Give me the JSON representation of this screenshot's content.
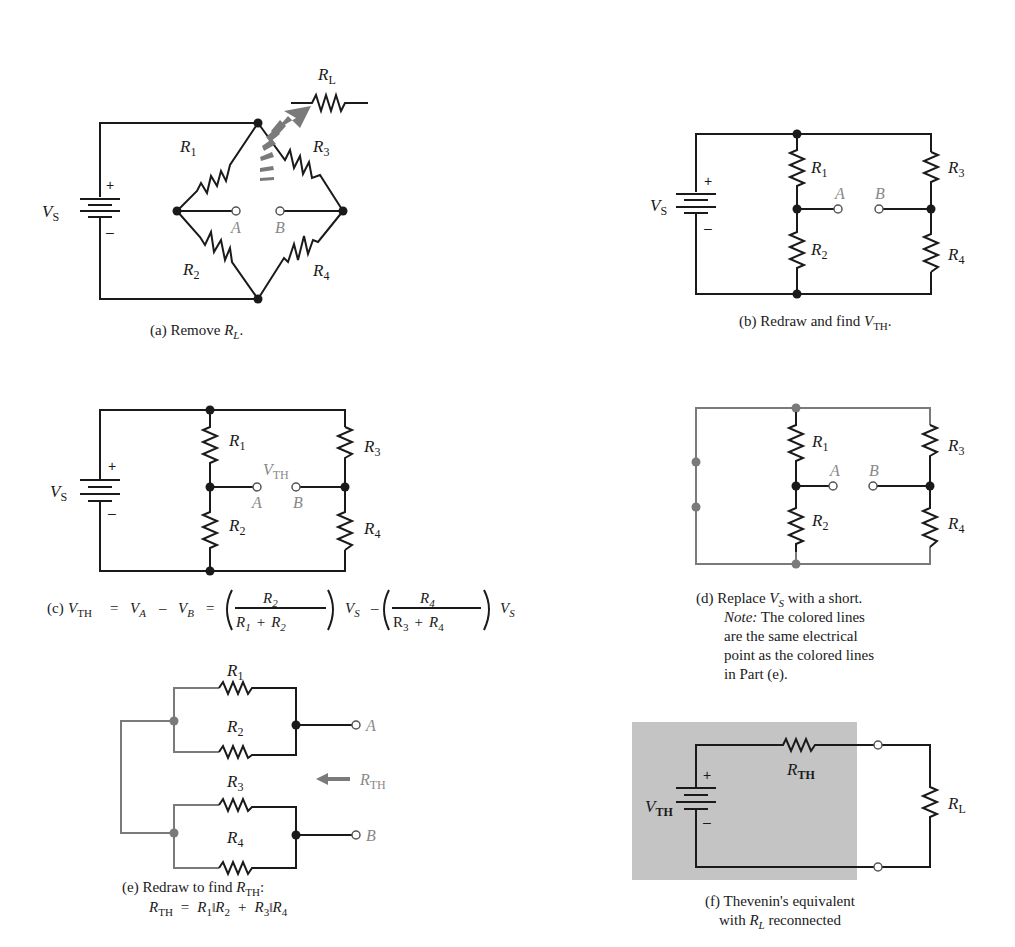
{
  "figure": {
    "panels": [
      {
        "id": "a",
        "caption_prefix": "(a) Remove ",
        "caption_var": "R",
        "caption_sub": "L",
        "caption_suffix": ".",
        "labels": {
          "source": "V",
          "source_sub": "S",
          "r1": "R",
          "r1_sub": "1",
          "r2": "R",
          "r2_sub": "2",
          "r3": "R",
          "r3_sub": "3",
          "r4": "R",
          "r4_sub": "4",
          "rl": "R",
          "rl_sub": "L",
          "a": "A",
          "b": "B",
          "plus": "+",
          "minus": "–"
        }
      },
      {
        "id": "b",
        "caption_prefix": "(b) Redraw and find ",
        "caption_var": "V",
        "caption_sub": "TH",
        "caption_suffix": ".",
        "labels": {
          "source": "V",
          "source_sub": "S",
          "r1": "R",
          "r1_sub": "1",
          "r2": "R",
          "r2_sub": "2",
          "r3": "R",
          "r3_sub": "3",
          "r4": "R",
          "r4_sub": "4",
          "a": "A",
          "b": "B",
          "plus": "+",
          "minus": "–"
        }
      },
      {
        "id": "c",
        "caption_prefix": "(c) ",
        "equation": {
          "lhs": "V",
          "lhs_sub": "TH",
          "eq1": "=",
          "va": "V",
          "va_sub": "A",
          "minus": "–",
          "vb": "V",
          "vb_sub": "B",
          "eq2": "=",
          "frac1_num": "R",
          "frac1_num_sub": "2",
          "frac1_den_a": "R",
          "frac1_den_a_sub": "1",
          "frac1_den_plus": "+",
          "frac1_den_b": "R",
          "frac1_den_b_sub": "2",
          "vs1": "V",
          "vs1_sub": "S",
          "frac2_num": "R",
          "frac2_num_sub": "4",
          "frac2_den_a": "R",
          "frac2_den_a_sub": "3",
          "frac2_den_plus": "+",
          "frac2_den_b": "R",
          "frac2_den_b_sub": "4",
          "vs2": "V",
          "vs2_sub": "S"
        },
        "labels": {
          "source": "V",
          "source_sub": "S",
          "r1": "R",
          "r1_sub": "1",
          "r2": "R",
          "r2_sub": "2",
          "r3": "R",
          "r3_sub": "3",
          "r4": "R",
          "r4_sub": "4",
          "vth": "V",
          "vth_sub": "TH",
          "a": "A",
          "b": "B",
          "plus": "+",
          "minus": "–"
        }
      },
      {
        "id": "d",
        "caption_lines": [
          {
            "prefix": "(d) Replace ",
            "var": "V",
            "sub": "S",
            "suffix": " with a short."
          },
          {
            "italic": "Note:",
            "text": " The colored lines"
          },
          {
            "text": "are the same electrical"
          },
          {
            "text": "point as the colored lines"
          },
          {
            "text": "in Part (e)."
          }
        ],
        "labels": {
          "r1": "R",
          "r1_sub": "1",
          "r2": "R",
          "r2_sub": "2",
          "r3": "R",
          "r3_sub": "3",
          "r4": "R",
          "r4_sub": "4",
          "a": "A",
          "b": "B"
        }
      },
      {
        "id": "e",
        "caption_line1_prefix": "(e) Redraw to find ",
        "caption_line1_var": "R",
        "caption_line1_sub": "TH",
        "caption_line1_suffix": ":",
        "caption_line2": {
          "lhs": "R",
          "lhs_sub": "TH",
          "eq": "=",
          "t1": "R",
          "t1_sub": "1",
          "par1": "‖",
          "t2": "R",
          "t2_sub": "2",
          "plus": "+",
          "t3": "R",
          "t3_sub": "3",
          "par2": "‖",
          "t4": "R",
          "t4_sub": "4"
        },
        "labels": {
          "r1": "R",
          "r1_sub": "1",
          "r2": "R",
          "r2_sub": "2",
          "r3": "R",
          "r3_sub": "3",
          "r4": "R",
          "r4_sub": "4",
          "a": "A",
          "b": "B",
          "rth": "R",
          "rth_sub": "TH"
        }
      },
      {
        "id": "f",
        "caption_line1": "(f) Thevenin's equivalent",
        "caption_line2_prefix": "with ",
        "caption_line2_var": "R",
        "caption_line2_sub": "L",
        "caption_line2_suffix": " reconnected",
        "labels": {
          "vth": "V",
          "vth_sub": "TH",
          "rth": "R",
          "rth_sub": "TH",
          "rl": "R",
          "rl_sub": "L",
          "plus": "+",
          "minus": "–"
        }
      }
    ],
    "colors": {
      "wire": "#1a1a1a",
      "highlight": "#7a7a7a",
      "shade": "#c4c4c4",
      "terminal_label": "#888888"
    }
  }
}
